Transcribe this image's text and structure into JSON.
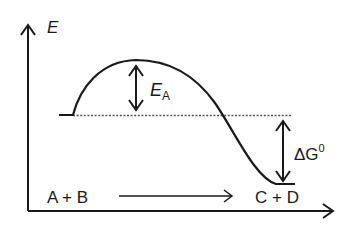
{
  "diagram": {
    "type": "reaction-energy-profile",
    "y_axis": {
      "label": "E"
    },
    "x_axis": {
      "label": ""
    },
    "activation_energy": {
      "label_main": "E",
      "label_sub": "A"
    },
    "free_energy_change": {
      "label_main": "ΔG",
      "label_sup": "0"
    },
    "reactants": {
      "label": "A + B"
    },
    "products": {
      "label": "C + D"
    },
    "colors": {
      "line": "#1a1a1a",
      "dotted": "#555555",
      "background": "#ffffff"
    }
  }
}
